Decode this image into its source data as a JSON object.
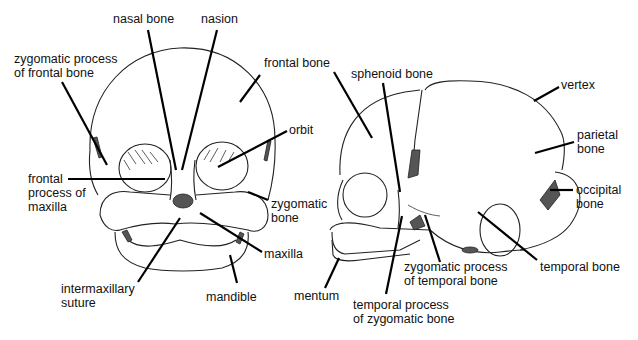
{
  "figure": {
    "front_view": {
      "labels": [
        {
          "id": "nasal-bone",
          "text": "nasal bone"
        },
        {
          "id": "nasion",
          "text": "nasion"
        },
        {
          "id": "zygomatic-process-of-frontal-bone",
          "text": "zygomatic process\nof frontal bone"
        },
        {
          "id": "frontal-bone-front",
          "text": "frontal bone"
        },
        {
          "id": "orbit",
          "text": "orbit"
        },
        {
          "id": "frontal-process-of-maxilla",
          "text": "frontal\nprocess of\nmaxilla"
        },
        {
          "id": "zygomatic-bone-front",
          "text": "zygomatic\nbone"
        },
        {
          "id": "maxilla",
          "text": "maxilla"
        },
        {
          "id": "intermaxillary-suture",
          "text": "intermaxillary\nsuture"
        },
        {
          "id": "mandible",
          "text": "mandible"
        }
      ]
    },
    "side_view": {
      "labels": [
        {
          "id": "sphenoid-bone",
          "text": "sphenoid bone"
        },
        {
          "id": "vertex",
          "text": "vertex"
        },
        {
          "id": "parietal-bone",
          "text": "parietal\nbone"
        },
        {
          "id": "occipital-bone",
          "text": "occipital\nbone"
        },
        {
          "id": "temporal-bone",
          "text": "temporal bone"
        },
        {
          "id": "zygomatic-process-of-temporal-bone",
          "text": "zygomatic process\nof temporal bone"
        },
        {
          "id": "temporal-process-of-zygomatic-bone",
          "text": "temporal process\nof zygomatic bone"
        },
        {
          "id": "mentum",
          "text": "mentum"
        }
      ]
    }
  }
}
